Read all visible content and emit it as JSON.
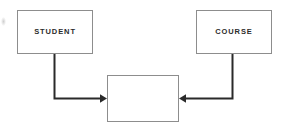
{
  "diagram": {
    "type": "entity-relationship-diagram",
    "canvas": {
      "width": 283,
      "height": 131,
      "background": "#ffffff"
    },
    "style": {
      "entity_border_color": "#8d8d8d",
      "entity_fill_color": "#ffffff",
      "connector_color": "#2a2a2a",
      "label_color": "#2b2b2b"
    },
    "entities": [
      {
        "id": "student",
        "label": "STUDENT",
        "x": 17,
        "y": 10,
        "width": 76,
        "height": 44
      },
      {
        "id": "course",
        "label": "COURSE",
        "x": 196,
        "y": 10,
        "width": 76,
        "height": 44
      }
    ],
    "relationship": {
      "id": "relationship",
      "label": "",
      "x": 107,
      "y": 75,
      "width": 72,
      "height": 47
    },
    "connectors": [
      {
        "id": "student-to-relationship",
        "from": "student",
        "to": "relationship",
        "arrow": "right",
        "path": "M 54.5 54 L 54.5 98.5 L 101 98.5"
      },
      {
        "id": "course-to-relationship",
        "from": "course",
        "to": "relationship",
        "arrow": "left",
        "path": "M 232.5 54 L 232.5 98.5 L 185 98.5"
      }
    ]
  }
}
